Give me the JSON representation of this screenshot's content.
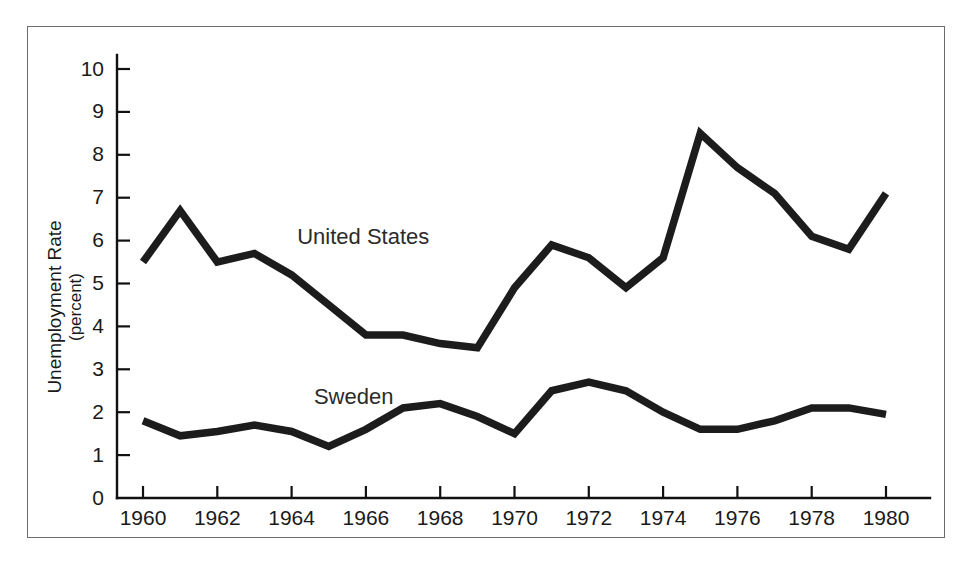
{
  "figure": {
    "frame_border_color": "#6d6d6d",
    "background_color": "#ffffff",
    "line_color": "#1c1c1c"
  },
  "axis": {
    "y_title_main": "Unemployment Rate",
    "y_title_sub": "(percent)",
    "y_ticks": [
      "0",
      "1",
      "2",
      "3",
      "4",
      "5",
      "6",
      "7",
      "8",
      "9",
      "10"
    ],
    "x_ticks": [
      "1960",
      "1962",
      "1964",
      "1966",
      "1968",
      "1970",
      "1972",
      "1974",
      "1976",
      "1978",
      "1980"
    ]
  },
  "labels": {
    "united_states": "United States",
    "sweden": "Sweden"
  },
  "chart_data": {
    "type": "line",
    "title": "",
    "xlabel": "",
    "ylabel": "Unemployment Rate (percent)",
    "xlim": [
      1959.3,
      1980.7
    ],
    "ylim": [
      0,
      10.4
    ],
    "grid": false,
    "legend": "inline-labels",
    "x": [
      1960,
      1961,
      1962,
      1963,
      1964,
      1965,
      1966,
      1967,
      1968,
      1969,
      1970,
      1971,
      1972,
      1973,
      1974,
      1975,
      1976,
      1977,
      1978,
      1979,
      1980
    ],
    "series": [
      {
        "name": "United States",
        "values": [
          5.5,
          6.7,
          5.5,
          5.7,
          5.2,
          4.5,
          3.8,
          3.8,
          3.6,
          3.5,
          4.9,
          5.9,
          5.6,
          4.9,
          5.6,
          8.5,
          7.7,
          7.1,
          6.1,
          5.8,
          7.1
        ]
      },
      {
        "name": "Sweden",
        "values": [
          1.8,
          1.45,
          1.55,
          1.7,
          1.55,
          1.2,
          1.6,
          2.1,
          2.2,
          1.9,
          1.5,
          2.5,
          2.7,
          2.5,
          2.0,
          1.6,
          1.6,
          1.8,
          2.1,
          2.1,
          1.95
        ]
      }
    ]
  }
}
